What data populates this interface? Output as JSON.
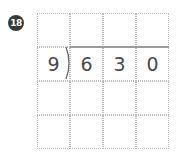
{
  "problem": {
    "number_label": "18",
    "divisor": "9",
    "dividend_digits": [
      "6",
      "3",
      "0"
    ],
    "grid": {
      "rows": 4,
      "cols": 4
    },
    "colors": {
      "badge": "#3a3a3a",
      "digits": "#4a4a4a",
      "grid_line": "#bdbdbd"
    }
  }
}
